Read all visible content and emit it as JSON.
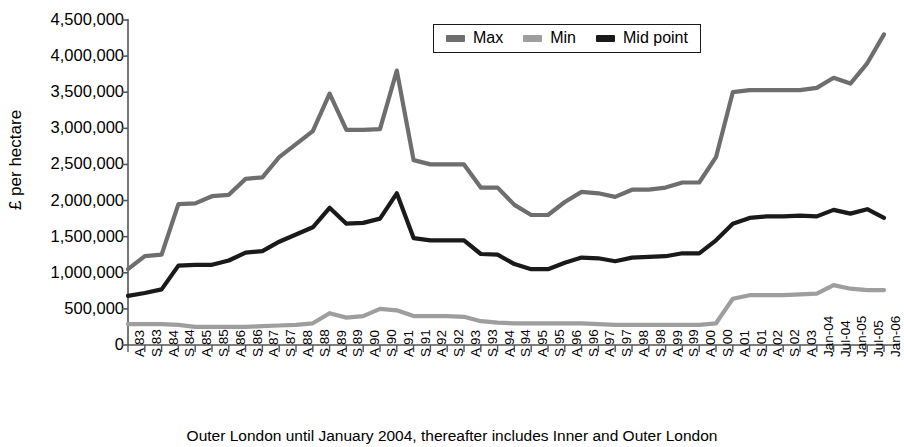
{
  "chart_data": {
    "type": "line",
    "title": "",
    "xlabel": "",
    "ylabel": "£ per hectare",
    "ylim": [
      0,
      4500000
    ],
    "ytick_values": [
      0,
      500000,
      1000000,
      1500000,
      2000000,
      2500000,
      3000000,
      3500000,
      4000000,
      4500000
    ],
    "ytick_labels": [
      "0",
      "500,000",
      "1,000,000",
      "1,500,000",
      "2,000,000",
      "2,500,000",
      "3,000,000",
      "3,500,000",
      "4,000,000",
      "4,500,000"
    ],
    "grid": false,
    "legend_position": "top-center",
    "categories": [
      "A 83",
      "S 83",
      "A 84",
      "S 84",
      "A 85",
      "S 85",
      "A 86",
      "S 86",
      "A 87",
      "S 87",
      "A 88",
      "S 88",
      "A 89",
      "S 89",
      "A 90",
      "S 90",
      "A 91",
      "S 91",
      "A 92",
      "S 92",
      "A 93",
      "S 93",
      "A 94",
      "S 94",
      "A 95",
      "S 95",
      "A 96",
      "S 96",
      "A 97",
      "S 97",
      "A 98",
      "S 98",
      "A 99",
      "S 99",
      "A 00",
      "S 00",
      "A 01",
      "S 01",
      "A 02",
      "S 02",
      "A 03",
      "Jan-04",
      "Jul-04",
      "Jan-05",
      "Jul-05",
      "Jan-06"
    ],
    "series": [
      {
        "name": "Max",
        "color": "#6e6e6e",
        "values": [
          1050000,
          1230000,
          1250000,
          1950000,
          1960000,
          2060000,
          2080000,
          2300000,
          2320000,
          2600000,
          2780000,
          2960000,
          3480000,
          2980000,
          2980000,
          2990000,
          3800000,
          2560000,
          2500000,
          2500000,
          2500000,
          2180000,
          2180000,
          1940000,
          1800000,
          1800000,
          1980000,
          2120000,
          2100000,
          2050000,
          2150000,
          2150000,
          2180000,
          2250000,
          2250000,
          2600000,
          3500000,
          3530000,
          3530000,
          3530000,
          3530000,
          3560000,
          3700000,
          3620000,
          3900000,
          4300000
        ]
      },
      {
        "name": "Min",
        "color": "#9e9e9e",
        "values": [
          290000,
          290000,
          290000,
          280000,
          250000,
          250000,
          250000,
          250000,
          260000,
          270000,
          280000,
          300000,
          440000,
          380000,
          400000,
          500000,
          480000,
          400000,
          400000,
          400000,
          390000,
          330000,
          310000,
          300000,
          300000,
          300000,
          300000,
          300000,
          290000,
          280000,
          280000,
          280000,
          280000,
          280000,
          280000,
          300000,
          640000,
          690000,
          690000,
          690000,
          700000,
          710000,
          830000,
          780000,
          760000,
          760000
        ]
      },
      {
        "name": "Mid point",
        "color": "#1a1a1a",
        "values": [
          680000,
          720000,
          770000,
          1100000,
          1110000,
          1110000,
          1170000,
          1280000,
          1300000,
          1430000,
          1530000,
          1630000,
          1900000,
          1680000,
          1690000,
          1750000,
          2100000,
          1480000,
          1450000,
          1450000,
          1450000,
          1260000,
          1250000,
          1120000,
          1050000,
          1050000,
          1140000,
          1210000,
          1200000,
          1160000,
          1210000,
          1220000,
          1230000,
          1270000,
          1270000,
          1450000,
          1680000,
          1760000,
          1780000,
          1780000,
          1790000,
          1780000,
          1870000,
          1820000,
          1880000,
          1760000
        ]
      }
    ]
  },
  "legend": {
    "items": [
      {
        "label": "Max",
        "color": "#6e6e6e"
      },
      {
        "label": "Min",
        "color": "#9e9e9e"
      },
      {
        "label": "Mid point",
        "color": "#1a1a1a"
      }
    ]
  },
  "caption": "Outer London until January 2004, thereafter includes Inner and Outer London"
}
